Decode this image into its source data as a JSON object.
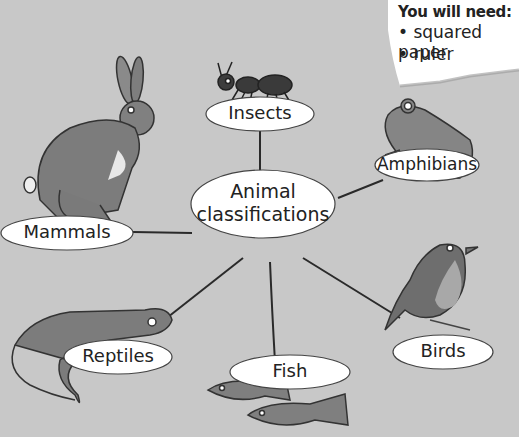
{
  "note": {
    "title": "You will need:",
    "items": [
      "• squared paper",
      "• ruler"
    ]
  },
  "diagram": {
    "center": "Animal classifications",
    "center_line1": "Animal",
    "center_line2": "classifications",
    "nodes": [
      {
        "label": "Insects",
        "animal": "ant"
      },
      {
        "label": "Amphibians",
        "animal": "frog"
      },
      {
        "label": "Birds",
        "animal": "robin"
      },
      {
        "label": "Fish",
        "animal": "fish"
      },
      {
        "label": "Reptiles",
        "animal": "lizard"
      },
      {
        "label": "Mammals",
        "animal": "hare"
      }
    ]
  },
  "colors": {
    "background": "#c8c8c8",
    "node_fill": "#ffffff",
    "line": "#2a2a2a",
    "animal": "#808080"
  }
}
